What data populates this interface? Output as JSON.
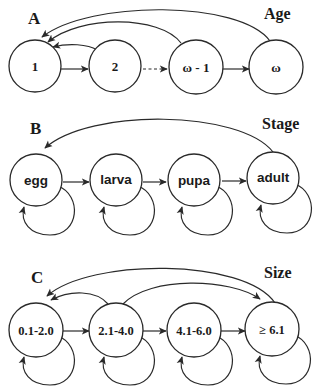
{
  "panels": [
    {
      "letter": "A",
      "title": "Age",
      "nodes": [
        "1",
        "2",
        "ω - 1",
        "ω"
      ],
      "forward_edges": [
        {
          "from": "1",
          "to": "2",
          "style": "solid"
        },
        {
          "from": "2",
          "to": "ω - 1",
          "style": "dashed"
        },
        {
          "from": "ω - 1",
          "to": "ω",
          "style": "solid"
        }
      ],
      "back_edges": [
        {
          "from": "2",
          "to": "1"
        },
        {
          "from": "ω - 1",
          "to": "1"
        },
        {
          "from": "ω",
          "to": "1"
        }
      ],
      "self_loops": []
    },
    {
      "letter": "B",
      "title": "Stage",
      "nodes": [
        "egg",
        "larva",
        "pupa",
        "adult"
      ],
      "forward_edges": [
        {
          "from": "egg",
          "to": "larva",
          "style": "solid"
        },
        {
          "from": "larva",
          "to": "pupa",
          "style": "solid"
        },
        {
          "from": "pupa",
          "to": "adult",
          "style": "solid"
        }
      ],
      "back_edges": [
        {
          "from": "adult",
          "to": "egg"
        }
      ],
      "self_loops": [
        "egg",
        "larva",
        "pupa",
        "adult"
      ]
    },
    {
      "letter": "C",
      "title": "Size",
      "nodes": [
        "0.1-2.0",
        "2.1-4.0",
        "4.1-6.0",
        "≥ 6.1"
      ],
      "forward_edges": [
        {
          "from": "0.1-2.0",
          "to": "2.1-4.0",
          "style": "solid"
        },
        {
          "from": "2.1-4.0",
          "to": "4.1-6.0",
          "style": "solid"
        },
        {
          "from": "4.1-6.0",
          "to": "≥ 6.1",
          "style": "solid"
        }
      ],
      "back_edges": [
        {
          "from": "2.1-4.0",
          "to": "0.1-2.0"
        },
        {
          "from": "≥ 6.1",
          "to": "0.1-2.0"
        },
        {
          "from": "2.1-4.0",
          "to": "≥ 6.1"
        }
      ],
      "self_loops": [
        "0.1-2.0",
        "2.1-4.0",
        "4.1-6.0",
        "≥ 6.1"
      ]
    }
  ],
  "colors": {
    "stroke": "#2a2a2a",
    "background": "#ffffff"
  }
}
